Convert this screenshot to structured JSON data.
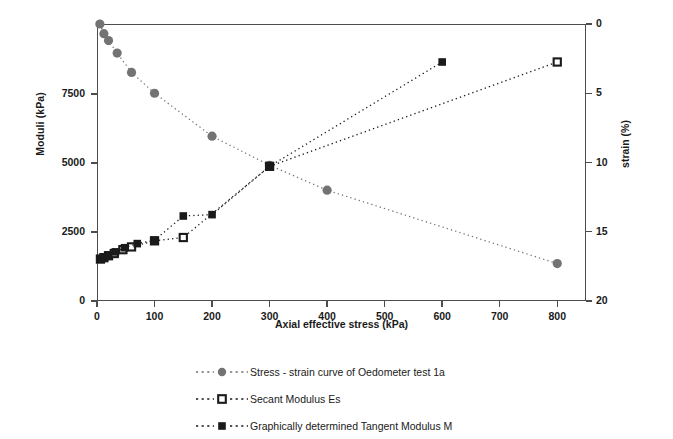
{
  "chart_data": {
    "type": "scatter",
    "title": "",
    "xlabel": "Axial effective stress (kPa)",
    "ylabel": "Moduli (kPa)",
    "y2label": "strain (%)",
    "xlim": [
      0,
      850
    ],
    "ylim": [
      0,
      10037
    ],
    "y2lim": [
      0,
      20
    ],
    "grid": false,
    "legend_position": "bottom",
    "xticks": [
      0,
      100,
      200,
      300,
      400,
      500,
      600,
      700,
      800
    ],
    "xticklabels": [
      "0",
      "100",
      "200",
      "300",
      "400",
      "500",
      "600",
      "700",
      "800"
    ],
    "yticks": [
      0,
      2500,
      5000,
      7500
    ],
    "yticklabels": [
      "0",
      "2500",
      "5000",
      "7500"
    ],
    "y2ticks": [
      0,
      5,
      10,
      15,
      20
    ],
    "y2ticklabels": [
      "0",
      "5",
      "10",
      "15",
      "20"
    ],
    "series": [
      {
        "name": "Stress - strain curve of Oedometer test 1a",
        "axis": "right",
        "marker": "circle-filled",
        "color": "#737373",
        "line": "dotted",
        "x": [
          5,
          12,
          20,
          35,
          60,
          100,
          200,
          300,
          400,
          800
        ],
        "y": [
          0.0,
          0.7,
          1.2,
          2.1,
          3.5,
          5.0,
          8.1,
          10.2,
          12.0,
          17.3
        ]
      },
      {
        "name": "Secant Modulus Es",
        "axis": "left",
        "marker": "square-open",
        "color": "#1a1a1a",
        "line": "dotted",
        "x": [
          6,
          12,
          20,
          30,
          45,
          60,
          100,
          150,
          300,
          800
        ],
        "y": [
          1520,
          1570,
          1640,
          1720,
          1860,
          1960,
          2180,
          2300,
          4880,
          8660
        ]
      },
      {
        "name": "Graphically determined Tangent Modulus M",
        "axis": "left",
        "marker": "square-filled",
        "color": "#1a1a1a",
        "line": "dotted",
        "x": [
          5,
          12,
          20,
          32,
          48,
          70,
          100,
          150,
          200,
          300,
          600
        ],
        "y": [
          1530,
          1590,
          1660,
          1780,
          1930,
          2080,
          2200,
          3080,
          3130,
          4880,
          8660
        ]
      }
    ]
  },
  "axes": {
    "x_title": "Axial effective stress (kPa)",
    "y_left_title": "Moduli (kPa)",
    "y_right_title": "strain (%)"
  },
  "legend": {
    "items": [
      {
        "label": "Stress - strain curve of Oedometer test 1a",
        "marker": "circle-filled",
        "color": "#737373"
      },
      {
        "label": "Secant Modulus Es",
        "marker": "square-open",
        "color": "#1a1a1a"
      },
      {
        "label": "Graphically determined Tangent Modulus M",
        "marker": "square-filled",
        "color": "#1a1a1a"
      }
    ]
  }
}
